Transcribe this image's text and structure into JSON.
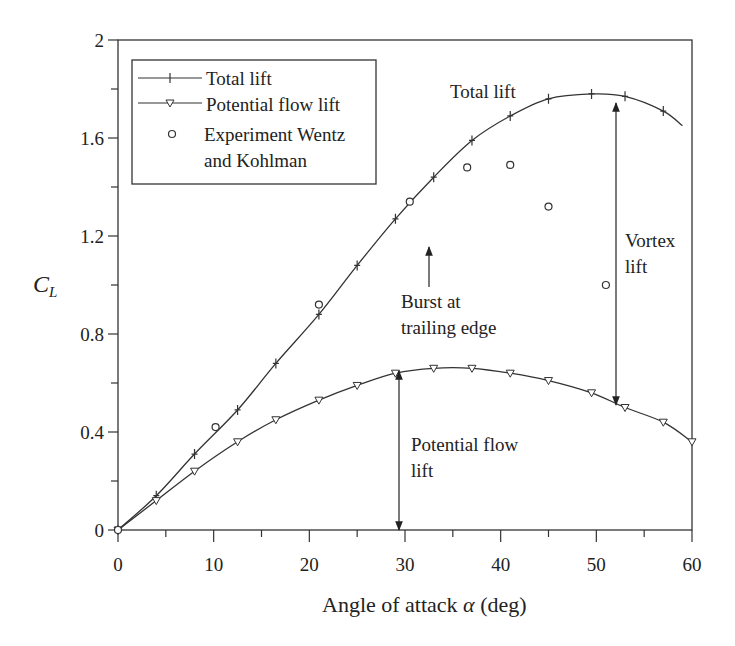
{
  "chart_data": {
    "type": "line",
    "title": "",
    "xlabel": "Angle of attack α (deg)",
    "ylabel": "C_L",
    "xlim": [
      0,
      60
    ],
    "ylim": [
      0,
      2
    ],
    "x_ticks": [
      0,
      10,
      20,
      30,
      40,
      50,
      60
    ],
    "y_ticks": [
      "0",
      "0.4",
      "0.8",
      "1.2",
      "1.6",
      "2"
    ],
    "y_tick_values": [
      0,
      0.4,
      0.8,
      1.2,
      1.6,
      2
    ],
    "grid": false,
    "legend_position": "upper left",
    "series": [
      {
        "name": "Total lift",
        "marker": "plus",
        "x": [
          0,
          4,
          8,
          12.5,
          16.5,
          21,
          25,
          29,
          33,
          37,
          41,
          45,
          49.5,
          53,
          57,
          59
        ],
        "y": [
          0,
          0.14,
          0.31,
          0.49,
          0.68,
          0.88,
          1.08,
          1.27,
          1.44,
          1.59,
          1.69,
          1.76,
          1.78,
          1.77,
          1.71,
          1.65
        ]
      },
      {
        "name": "Potential flow lift",
        "marker": "triangle-down",
        "x": [
          0,
          4,
          8,
          12.5,
          16.5,
          21,
          25,
          29,
          33,
          37,
          41,
          45,
          49.5,
          53,
          57,
          60
        ],
        "y": [
          0,
          0.12,
          0.24,
          0.36,
          0.45,
          0.53,
          0.59,
          0.64,
          0.66,
          0.66,
          0.64,
          0.61,
          0.56,
          0.5,
          0.44,
          0.36
        ]
      },
      {
        "name": "Experiment Wentz and Kohlman",
        "marker": "circle",
        "x": [
          0,
          10.2,
          21,
          30.5,
          36.5,
          41,
          45,
          51
        ],
        "y": [
          0,
          0.42,
          0.92,
          1.34,
          1.48,
          1.49,
          1.32,
          1.0
        ]
      }
    ],
    "annotations": [
      {
        "text": "Total lift",
        "x": 37,
        "y": 1.8
      },
      {
        "text": "Burst at trailing edge",
        "arrow_to": [
          32.5,
          1.45
        ]
      },
      {
        "text": "Vortex lift",
        "arrow_between_x": 52,
        "from_y": 0.5,
        "to_y": 1.77
      },
      {
        "text": "Potential flow lift",
        "arrow_between_x": 29.3,
        "from_y": 0,
        "to_y": 0.65
      }
    ]
  },
  "legend": {
    "items": [
      "Total lift",
      "Potential flow lift",
      "Experiment Wentz",
      "and  Kohlman"
    ]
  },
  "annotations": {
    "total_lift": "Total lift",
    "burst_line1": "Burst at",
    "burst_line2": "trailing edge",
    "vortex_line1": "Vortex",
    "vortex_line2": "lift",
    "potential_line1": "Potential flow",
    "potential_line2": "lift"
  },
  "axes": {
    "xlabel_prefix": "Angle of attack ",
    "xlabel_symbol": "α",
    "xlabel_suffix": " (deg)",
    "ylabel_main": "C",
    "ylabel_sub": "L"
  }
}
